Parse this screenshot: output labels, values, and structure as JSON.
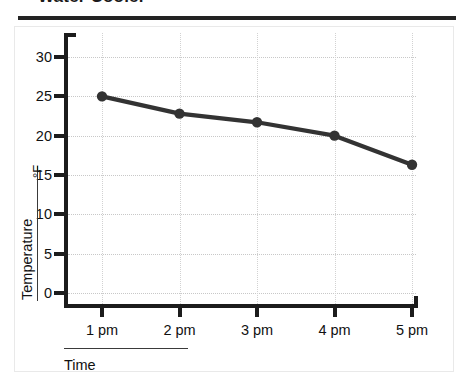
{
  "title": "Water Cooler",
  "chart_data": {
    "type": "line",
    "title": "Water Cooler",
    "xlabel": "Time",
    "ylabel": "Temperature",
    "yunit": "°F",
    "categories": [
      "1 pm",
      "2 pm",
      "3 pm",
      "4 pm",
      "5 pm"
    ],
    "values": [
      25,
      22.8,
      21.7,
      20,
      16.3
    ],
    "series": [
      {
        "name": "Temperature",
        "values": [
          25,
          22.8,
          21.7,
          20,
          16.3
        ]
      }
    ],
    "yticks": [
      0,
      5,
      10,
      15,
      20,
      25,
      30
    ],
    "ytick_labels": [
      "0",
      "5",
      "10",
      "15",
      "20",
      "25",
      "30"
    ],
    "ylim": [
      0,
      30
    ],
    "grid": "dotted",
    "legend": "none",
    "line_color": "#333333",
    "marker": "circle",
    "marker_color": "#333333"
  },
  "colors": {
    "axis": "#1c1c1c",
    "grid": "#c8c8c8",
    "line": "#333333",
    "frame": "#e9e9e9",
    "text": "#111111"
  }
}
